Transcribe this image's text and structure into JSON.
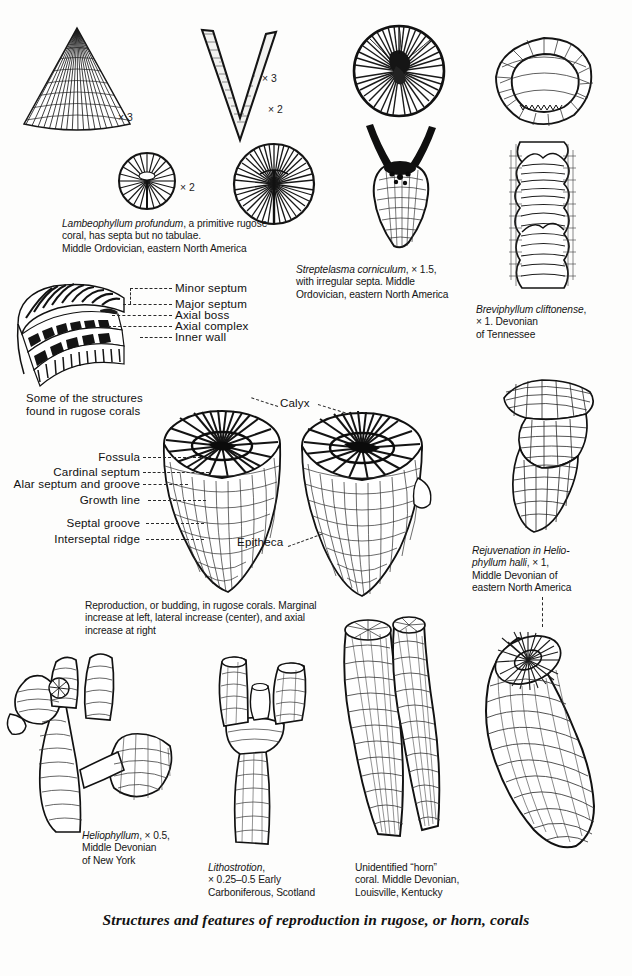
{
  "plate": {
    "title": "Structures and features of reproduction in rugose, or horn, corals",
    "background_color": "#fdfdfc",
    "ink_color": "#1a1a1a"
  },
  "magnifications": [
    {
      "id": "mag-lambeo-fan",
      "text": "× 3"
    },
    {
      "id": "mag-lambeo-v",
      "text": "× 3"
    },
    {
      "id": "mag-lambeo-small-disc",
      "text": "× 2"
    },
    {
      "id": "mag-lambeo-large-disc",
      "text": "× 2"
    }
  ],
  "captions": {
    "lambeophyllum": {
      "species": "Lambeophyllum profundum",
      "rest": ", a primitive rugose\ncoral, has septa but no tabulae.\nMiddle Ordovician, eastern North America"
    },
    "streptelasma": {
      "species": "Streptelasma corniculum",
      "rest": ", × 1.5,\nwith irregular septa. Middle\nOrdovician, eastern North America"
    },
    "breviphyllum": {
      "species": "Breviphyllum cliftonense",
      "rest": ",\n× 1. Devonian\nof Tennessee"
    },
    "structures_note": "Some of the structures\nfound in rugose corals",
    "reproduction": "Reproduction, or budding, in rugose corals. Marginal\nincrease at left, lateral increase (center), and axial\nincrease at right",
    "rejuvenation": {
      "species": "Rejuvenation in Helio-\nphyllum halli",
      "rest": ", × 1,\nMiddle Devonian of\neastern North America"
    },
    "heliophyllum": {
      "species": "Heliophyllum",
      "rest": ", × 0.5,\nMiddle Devonian\nof New York"
    },
    "lithostrotion": {
      "species": "Lithostrotion",
      "rest": ",\n× 0.25–0.5 Early\nCarboniferous, Scotland"
    },
    "unidentified_horn": "Unidentified “horn”\ncoral. Middle Devonian,\nLouisville, Kentucky"
  },
  "anatomy_labels_upper": [
    {
      "id": "minor-septum",
      "text": "Minor septum"
    },
    {
      "id": "major-septum",
      "text": "Major septum"
    },
    {
      "id": "axial-boss",
      "text": "Axial boss"
    },
    {
      "id": "axial-complex",
      "text": "Axial complex"
    },
    {
      "id": "inner-wall",
      "text": "Inner wall"
    }
  ],
  "anatomy_labels_middle": [
    {
      "id": "calyx",
      "text": "Calyx"
    },
    {
      "id": "fossula",
      "text": "Fossula"
    },
    {
      "id": "cardinal-septum",
      "text": "Cardinal septum"
    },
    {
      "id": "alar-septum-and-groove",
      "text": "Alar septum and groove"
    },
    {
      "id": "growth-line",
      "text": "Growth line"
    },
    {
      "id": "septal-groove",
      "text": "Septal groove"
    },
    {
      "id": "interseptal-ridge",
      "text": "Interseptal ridge"
    },
    {
      "id": "epitheca",
      "text": "Epitheca"
    }
  ],
  "figures": [
    {
      "id": "lambeophyllum-fan-section",
      "kind": "illustration"
    },
    {
      "id": "lambeophyllum-v-section",
      "kind": "illustration"
    },
    {
      "id": "lambeophyllum-small-disc",
      "kind": "illustration"
    },
    {
      "id": "lambeophyllum-large-disc",
      "kind": "illustration"
    },
    {
      "id": "streptelasma-calyx-disc",
      "kind": "illustration"
    },
    {
      "id": "streptelasma-corallum",
      "kind": "illustration"
    },
    {
      "id": "breviphyllum-ring-section",
      "kind": "illustration"
    },
    {
      "id": "breviphyllum-longitudinal",
      "kind": "illustration"
    },
    {
      "id": "rugose-structures-cutaway",
      "kind": "illustration"
    },
    {
      "id": "budding-coral-left",
      "kind": "illustration"
    },
    {
      "id": "budding-coral-right",
      "kind": "illustration"
    },
    {
      "id": "rejuvenation-heliophyllum-halli",
      "kind": "illustration"
    },
    {
      "id": "heliophyllum-colony",
      "kind": "illustration"
    },
    {
      "id": "lithostrotion-branching",
      "kind": "illustration"
    },
    {
      "id": "unidentified-horn-coral-pair",
      "kind": "illustration"
    },
    {
      "id": "horn-coral-spiral",
      "kind": "illustration"
    }
  ]
}
